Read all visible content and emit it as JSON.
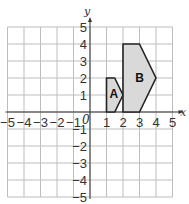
{
  "diagram": {
    "type": "coordinate-plane",
    "x_axis": {
      "label": "x",
      "min": -5,
      "max": 5,
      "ticks": [
        "-5",
        "-4",
        "-3",
        "-2",
        "-1",
        "1",
        "2",
        "3",
        "4",
        "5"
      ]
    },
    "y_axis": {
      "label": "y",
      "min": -5,
      "max": 5,
      "ticks": [
        "5",
        "4",
        "3",
        "2",
        "1",
        "-1",
        "-2",
        "-3",
        "-4",
        "-5"
      ]
    },
    "origin_label": "0",
    "shapes": [
      {
        "name": "A",
        "label": "A",
        "vertices": [
          [
            1,
            0
          ],
          [
            1,
            2
          ],
          [
            1.5,
            2
          ],
          [
            2,
            1
          ],
          [
            1.5,
            0
          ]
        ],
        "label_pos": [
          1.45,
          1.05
        ],
        "fill": "#d9d9d9"
      },
      {
        "name": "B",
        "label": "B",
        "vertices": [
          [
            2,
            0
          ],
          [
            2,
            4
          ],
          [
            3,
            4
          ],
          [
            4,
            2
          ],
          [
            3,
            0
          ]
        ],
        "label_pos": [
          3,
          2
        ],
        "fill": "#d9d9d9"
      }
    ]
  }
}
